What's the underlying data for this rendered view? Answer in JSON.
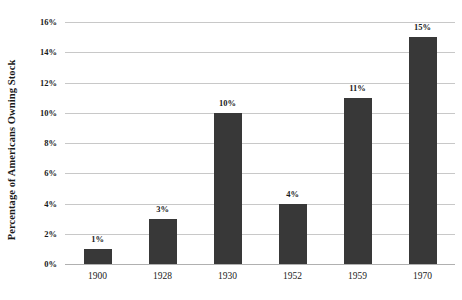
{
  "chart_data": {
    "type": "bar",
    "title": "",
    "subtitle": "",
    "xlabel": "",
    "ylabel": "Percentage of Americans Owning Stock",
    "categories": [
      "1900",
      "1928",
      "1930",
      "1952",
      "1959",
      "1970"
    ],
    "values": [
      1,
      3,
      10,
      4,
      11,
      15
    ],
    "value_labels": [
      "1%",
      "3%",
      "10%",
      "4%",
      "11%",
      "15%"
    ],
    "ylim": [
      0,
      16
    ],
    "ytick_values": [
      0,
      2,
      4,
      6,
      8,
      10,
      12,
      14,
      16
    ],
    "ytick_labels": [
      "0%",
      "2%",
      "4%",
      "6%",
      "8%",
      "10%",
      "12%",
      "14%",
      "16%"
    ],
    "grid": "horizontal",
    "legend": "none",
    "series": [
      {
        "name": "Percentage of Americans Owning Stock",
        "values": [
          1,
          3,
          10,
          4,
          11,
          15
        ]
      }
    ],
    "colors": {
      "bar": "#383838",
      "gridline": "#c8c8c8",
      "baseline": "#b0b0b0",
      "text": "#1a1a1a",
      "background": "#ffffff"
    }
  }
}
